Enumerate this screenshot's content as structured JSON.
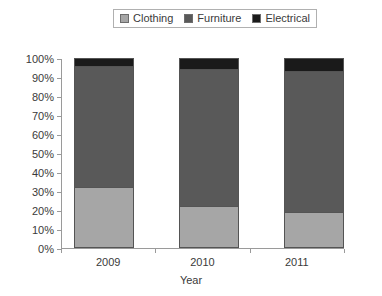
{
  "chart_data": {
    "type": "bar",
    "subtype": "stacked-100-percent",
    "title": "",
    "xlabel": "Year",
    "ylabel": "",
    "categories": [
      "2009",
      "2010",
      "2011"
    ],
    "series": [
      {
        "name": "Clothing",
        "values": [
          32,
          22,
          19
        ],
        "color": "#a6a6a6"
      },
      {
        "name": "Furniture",
        "values": [
          64,
          72,
          74
        ],
        "color": "#595959"
      },
      {
        "name": "Electrical",
        "values": [
          4,
          6,
          7
        ],
        "color": "#1a1a1a"
      }
    ],
    "ylim": [
      0,
      100
    ],
    "ytick_labels": [
      "0%",
      "10%",
      "20%",
      "30%",
      "40%",
      "50%",
      "60%",
      "70%",
      "80%",
      "90%",
      "100%"
    ],
    "ytick_values": [
      0,
      10,
      20,
      30,
      40,
      50,
      60,
      70,
      80,
      90,
      100
    ],
    "grid": false,
    "legend_position": "top-center",
    "unit": "%"
  },
  "axis": {
    "x_title": "Year"
  },
  "colors": {
    "clothing": "#a6a6a6",
    "furniture": "#595959",
    "electrical": "#1a1a1a",
    "axis_line": "#9a9a9a",
    "bar_outline": "#545454",
    "text": "#3a3a3a",
    "legend_border": "#b0b0b0",
    "background": "#ffffff"
  }
}
